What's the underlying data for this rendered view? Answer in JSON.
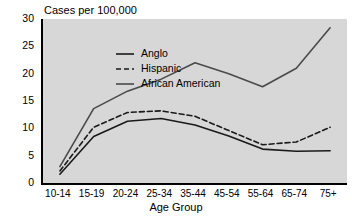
{
  "chart_data": {
    "type": "line",
    "title": "Cases per 100,000",
    "xlabel": "Age Group",
    "ylabel": "",
    "ylim": [
      0,
      30
    ],
    "yticks": [
      0,
      5,
      10,
      15,
      20,
      25,
      30
    ],
    "grid": false,
    "legend_position": "top-left inside plot",
    "categories": [
      "10-14",
      "15-19",
      "20-24",
      "25-34",
      "35-44",
      "45-54",
      "55-64",
      "65-74",
      "75+"
    ],
    "series": [
      {
        "name": "Anglo",
        "style": "solid",
        "color": "#1a1a1a",
        "values": [
          1.6,
          8.5,
          11.3,
          11.8,
          10.6,
          8.6,
          6.2,
          5.8,
          5.9
        ]
      },
      {
        "name": "Hispanic",
        "style": "dashed",
        "color": "#1a1a1a",
        "values": [
          2.2,
          10.2,
          12.9,
          13.2,
          12.2,
          9.6,
          7.0,
          7.5,
          10.2
        ]
      },
      {
        "name": "African American",
        "style": "solid",
        "color": "#4a4a4a",
        "values": [
          3.0,
          13.6,
          16.8,
          19.0,
          22.0,
          20.0,
          17.6,
          21.0,
          28.4
        ]
      }
    ]
  },
  "legend": {
    "items": [
      {
        "label": "Anglo",
        "swatch": "solid-line-swatch"
      },
      {
        "label": "Hispanic",
        "swatch": "dashed-line-swatch"
      },
      {
        "label": "African American",
        "swatch": "gray-line-swatch"
      }
    ]
  },
  "colors": {
    "plot_background": "#d7d7d7",
    "axis": "#000000",
    "page_background": "#ffffff",
    "anglo": "#1a1a1a",
    "hispanic": "#1a1a1a",
    "african_american": "#4a4a4a"
  }
}
